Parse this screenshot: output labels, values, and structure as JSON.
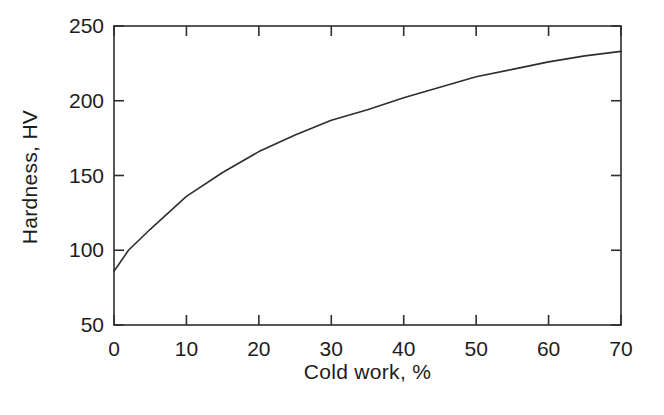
{
  "figure": {
    "background_color": "#ffffff",
    "line_color": "#2e2e2e",
    "text_color": "#1c1c1c"
  },
  "chart_data": {
    "type": "line",
    "title": "",
    "xlabel": "Cold work, %",
    "ylabel": "Hardness, HV",
    "xlim": [
      0,
      70
    ],
    "ylim": [
      50,
      250
    ],
    "x_ticks": [
      0,
      10,
      20,
      30,
      40,
      50,
      60,
      70
    ],
    "y_ticks": [
      50,
      100,
      150,
      200,
      250
    ],
    "grid": false,
    "legend": "none",
    "frame": "closed box with inward tick marks on all four sides",
    "series": [
      {
        "name": "hardness-vs-cold-work",
        "x": [
          0,
          2,
          5,
          10,
          15,
          20,
          25,
          30,
          35,
          40,
          45,
          50,
          55,
          60,
          65,
          70
        ],
        "y": [
          86,
          100,
          114,
          136,
          152,
          166,
          177,
          187,
          194,
          202,
          209,
          216,
          221,
          226,
          230,
          233
        ]
      }
    ]
  }
}
